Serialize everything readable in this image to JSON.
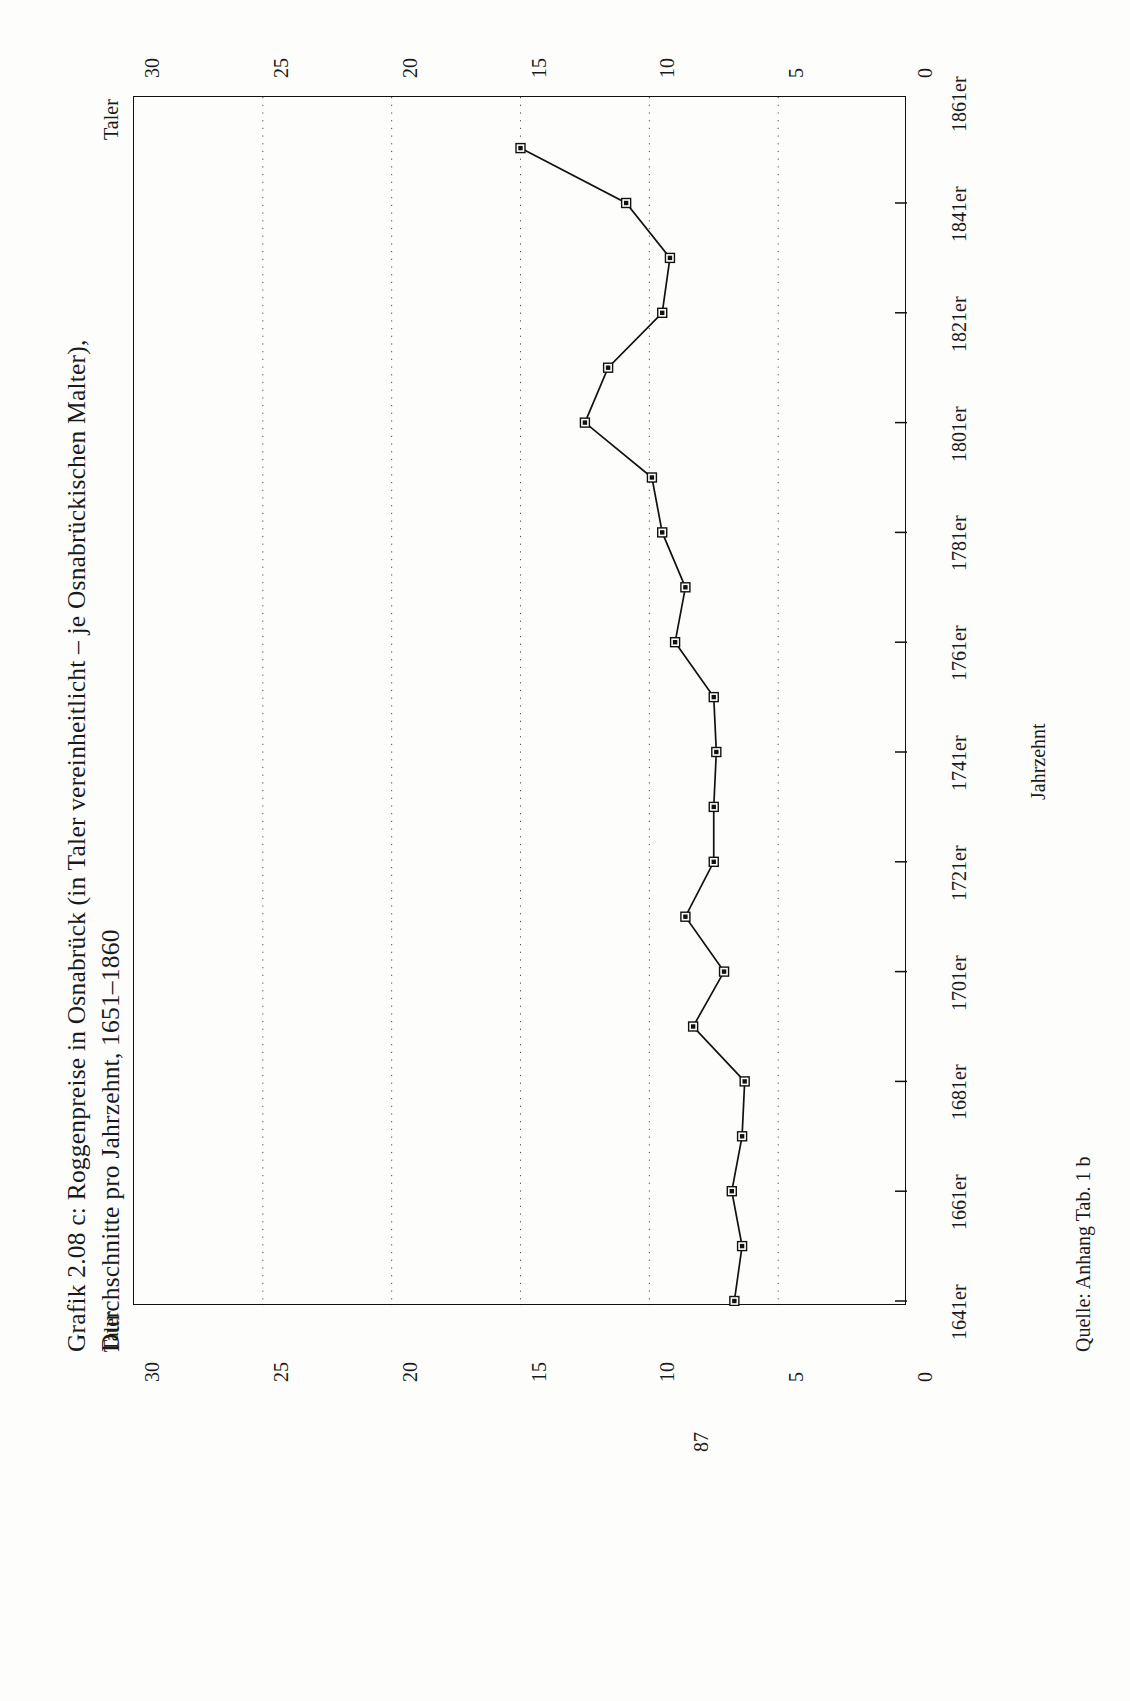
{
  "figure": {
    "title_line1": "Grafik 2.08 c:  Roggenpreise in Osnabrück (in Taler vereinheitlicht – je Osnabrückischen Malter),",
    "title_line2": "Durchschnitte pro Jahrzehnt, 1651–1860",
    "source": "Quelle: Anhang Tab. 1 b",
    "page_number": "87",
    "value_axis_caption_top": "Taler",
    "value_axis_caption_bottom": "Taler"
  },
  "chart_data": {
    "type": "line",
    "xlabel": "Jahrzehnt",
    "ylabel": "Taler",
    "orientation": "rotated-90-ccw",
    "grid": "dotted vertical gridlines at every value tick",
    "legend": "none",
    "ylim": [
      0,
      30
    ],
    "yticks": [
      0,
      5,
      10,
      15,
      20,
      25,
      30
    ],
    "ytick_labels": [
      "0",
      "5",
      "10",
      "15",
      "20",
      "25",
      "30"
    ],
    "xtick_labels": [
      "1641er",
      "1661er",
      "1681er",
      "1701er",
      "1721er",
      "1741er",
      "1761er",
      "1781er",
      "1801er",
      "1821er",
      "1841er",
      "1861er"
    ],
    "categories": [
      "1641er",
      "1651er",
      "1661er",
      "1671er",
      "1681er",
      "1691er",
      "1701er",
      "1711er",
      "1721er",
      "1731er",
      "1741er",
      "1751er",
      "1761er",
      "1771er",
      "1781er",
      "1791er",
      "1801er",
      "1811er",
      "1821er",
      "1831er",
      "1841er",
      "1851er"
    ],
    "values": [
      6.7,
      6.4,
      6.8,
      6.4,
      6.3,
      8.3,
      7.1,
      8.6,
      7.5,
      7.5,
      7.4,
      7.5,
      9.0,
      8.6,
      9.5,
      9.9,
      12.5,
      11.6,
      9.5,
      9.2,
      10.9,
      15.0
    ],
    "marker": "open square",
    "line_color": "#111111",
    "marker_color": "#111111"
  }
}
